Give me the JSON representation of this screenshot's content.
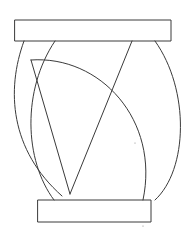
{
  "drawing": {
    "description": "Line sketch of a vase/barrel-like shape with top and bottom rectangles and crossing arcs",
    "stroke_color": "#3a3a3a",
    "background": "#ffffff",
    "stroke_width": 1,
    "top_rect": {
      "x": 15,
      "y": 20,
      "width": 156,
      "height": 21
    },
    "bottom_rect": {
      "x": 38,
      "y": 200,
      "width": 113,
      "height": 22
    },
    "left_outer_arc": "M 24 41 C 6 90, 10 150, 62 196",
    "left_inner_arc": "M 55 41 C 22 90, 24 160, 54 200",
    "big_arc": "M 31 60 C 100 55, 160 120, 143 200",
    "right_outer_arc": "M 155 41 C 190 90, 188 170, 155 200",
    "v_left_line": "M 31 60 L 70 194",
    "v_right_line": "M 70 194 L 132 41",
    "left_tick": "M 60 200 L 58 196",
    "dots": [
      {
        "x": 135,
        "y": 143
      },
      {
        "x": 143,
        "y": 226
      }
    ]
  }
}
